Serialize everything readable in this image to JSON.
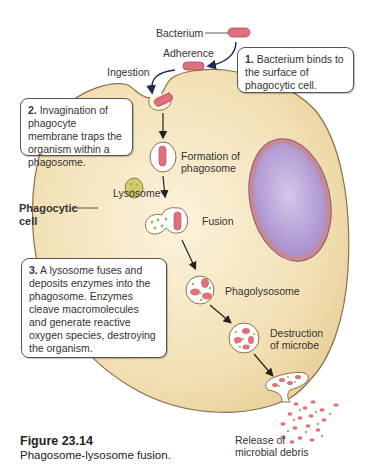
{
  "labels": {
    "bacterium": "Bacterium",
    "adherence": "Adherence",
    "ingestion": "Ingestion",
    "formation_line1": "Formation of",
    "formation_line2": "phagosome",
    "lysosome": "Lysosome",
    "phagocytic_line1": "Phagocytic",
    "phagocytic_line2": "cell",
    "fusion": "Fusion",
    "phagolysosome": "Phagolysosome",
    "destruction_line1": "Destruction",
    "destruction_line2": "of microbe",
    "release_line1": "Release of",
    "release_line2": "microbial debris"
  },
  "steps": [
    {
      "number": "1.",
      "text": "Bacterium binds to the surface of phagocytic cell."
    },
    {
      "number": "2.",
      "text": "Invagination of phagocyte membrane traps the organism within a phagosome."
    },
    {
      "number": "3.",
      "text": "A lysosome fuses and deposits enzymes into the phagosome. Enzymes cleave macromolecules and generate reactive oxygen species, destroying the organism."
    }
  ],
  "figure": {
    "number": "Figure 23.14",
    "caption": "Phagosome-lysosome fusion."
  },
  "colors": {
    "cell_fill": "#f3e2b8",
    "cell_outline": "#8a7048",
    "nucleus_fill": "#b9a3d6",
    "nucleus_rim": "#b87a8a",
    "bacterium": "#e0707a",
    "lysosome_fill": "#d9c96a",
    "enzyme_dots": "#8fbf4a"
  }
}
